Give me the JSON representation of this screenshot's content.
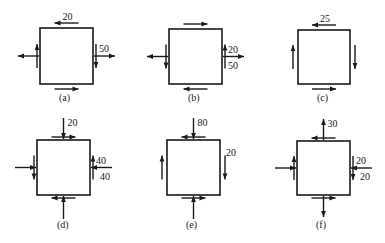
{
  "figure": {
    "panels": [
      {
        "id": "a",
        "caption": "(a)",
        "stresses": {
          "top": {
            "shear": "left",
            "label": "20"
          },
          "bottom": {
            "shear": "right"
          },
          "left": {
            "normal": "out",
            "shear": "up"
          },
          "right": {
            "normal": "out",
            "shear": "down",
            "label_normal": "50"
          }
        }
      },
      {
        "id": "b",
        "caption": "(b)",
        "stresses": {
          "top": {
            "shear": "right"
          },
          "bottom": {
            "shear": "left"
          },
          "left": {
            "normal": "out",
            "shear": "down"
          },
          "right": {
            "normal": "out",
            "shear": "up",
            "label_shear": "20",
            "label_normal": "50"
          }
        }
      },
      {
        "id": "c",
        "caption": "(c)",
        "stresses": {
          "top": {
            "shear": "left",
            "label": "25"
          },
          "bottom": {
            "shear": "right"
          },
          "left": {
            "shear": "up"
          },
          "right": {
            "shear": "down"
          }
        }
      },
      {
        "id": "d",
        "caption": "(d)",
        "stresses": {
          "top": {
            "normal": "in",
            "shear": "right",
            "label": "20"
          },
          "bottom": {
            "normal": "in",
            "shear": "left"
          },
          "left": {
            "normal": "in",
            "shear": "down"
          },
          "right": {
            "normal": "in",
            "shear": "up",
            "label_normal": "40",
            "label_shear": "40"
          }
        }
      },
      {
        "id": "e",
        "caption": "(e)",
        "stresses": {
          "top": {
            "normal": "in",
            "shear": "left",
            "label": "80"
          },
          "bottom": {
            "normal": "in",
            "shear": "right"
          },
          "left": {
            "shear": "up"
          },
          "right": {
            "shear": "down",
            "label_shear": "20"
          }
        }
      },
      {
        "id": "f",
        "caption": "(f)",
        "stresses": {
          "top": {
            "normal": "out",
            "shear": "left",
            "label": "30"
          },
          "bottom": {
            "normal": "out",
            "shear": "right"
          },
          "left": {
            "normal": "in",
            "shear": "up"
          },
          "right": {
            "normal": "in",
            "shear": "down",
            "label_shear": "20",
            "label_normal": "20"
          }
        }
      }
    ]
  }
}
